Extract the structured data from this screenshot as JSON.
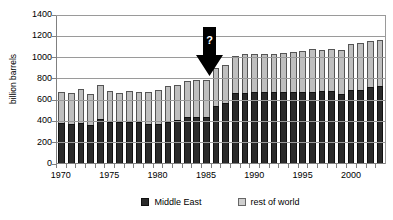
{
  "chart_data": {
    "type": "bar",
    "subtype": "stacked-column",
    "title": "",
    "xlabel": "",
    "ylabel": "billion barrels",
    "ylim": [
      0,
      1400
    ],
    "ytick_step": 200,
    "yticks": [
      0,
      200,
      400,
      600,
      800,
      1000,
      1200,
      1400
    ],
    "grid": true,
    "grid_axis": "y",
    "legend_position": "bottom",
    "x_tick_labels_shown": [
      "1970",
      "1975",
      "1980",
      "1985",
      "1990",
      "1995",
      "2000"
    ],
    "categories": [
      "1970",
      "1971",
      "1972",
      "1973",
      "1974",
      "1975",
      "1976",
      "1977",
      "1978",
      "1979",
      "1980",
      "1981",
      "1982",
      "1983",
      "1984",
      "1985",
      "1986",
      "1987",
      "1988",
      "1989",
      "1990",
      "1991",
      "1992",
      "1993",
      "1994",
      "1995",
      "1996",
      "1997",
      "1998",
      "1999",
      "2000",
      "2001",
      "2002",
      "2003"
    ],
    "series": [
      {
        "name": "Middle East",
        "color": "#2b2b2b",
        "values": [
          370,
          365,
          370,
          355,
          410,
          380,
          380,
          380,
          380,
          365,
          365,
          385,
          395,
          425,
          430,
          430,
          535,
          560,
          650,
          655,
          660,
          660,
          660,
          660,
          660,
          660,
          665,
          670,
          670,
          640,
          680,
          685,
          710,
          715
        ]
      },
      {
        "name": "rest of world",
        "color": "#bfbfbf",
        "values": [
          295,
          285,
          320,
          290,
          315,
          290,
          275,
          290,
          280,
          300,
          320,
          330,
          335,
          340,
          350,
          345,
          350,
          355,
          355,
          360,
          360,
          360,
          360,
          365,
          375,
          385,
          400,
          390,
          400,
          415,
          430,
          435,
          435,
          435
        ]
      }
    ],
    "totals": [
      665,
      650,
      690,
      645,
      725,
      670,
      655,
      670,
      660,
      665,
      685,
      715,
      730,
      765,
      780,
      775,
      885,
      915,
      1005,
      1015,
      1020,
      1020,
      1020,
      1025,
      1035,
      1045,
      1065,
      1060,
      1070,
      1055,
      1110,
      1120,
      1145,
      1150
    ],
    "annotations": [
      {
        "name": "question-arrow",
        "label": "?",
        "shape": "down-arrow",
        "color": "#000000",
        "label_color": "#ffffff",
        "points_at_category": "1986",
        "note": "Black downward arrow with white question mark highlighting the abrupt jump in reported Middle East reserves."
      }
    ]
  },
  "axis": {
    "y_title": "billion barrels",
    "y_labels": [
      "1400",
      "1200",
      "1000",
      "800",
      "600",
      "400",
      "200",
      "0"
    ],
    "x_labels": [
      "1970",
      "1975",
      "1980",
      "1985",
      "1990",
      "1995",
      "2000"
    ]
  },
  "legend": {
    "items": [
      {
        "label": "Middle East",
        "swatch": "dark-square"
      },
      {
        "label": "rest of world",
        "swatch": "light-square"
      }
    ]
  },
  "annotation": {
    "question_mark": "?"
  },
  "colors": {
    "middle_east": "#2b2b2b",
    "rest_of_world": "#bfbfbf",
    "axis": "#808080",
    "grid": "#9a9a9a",
    "arrow": "#000000"
  }
}
